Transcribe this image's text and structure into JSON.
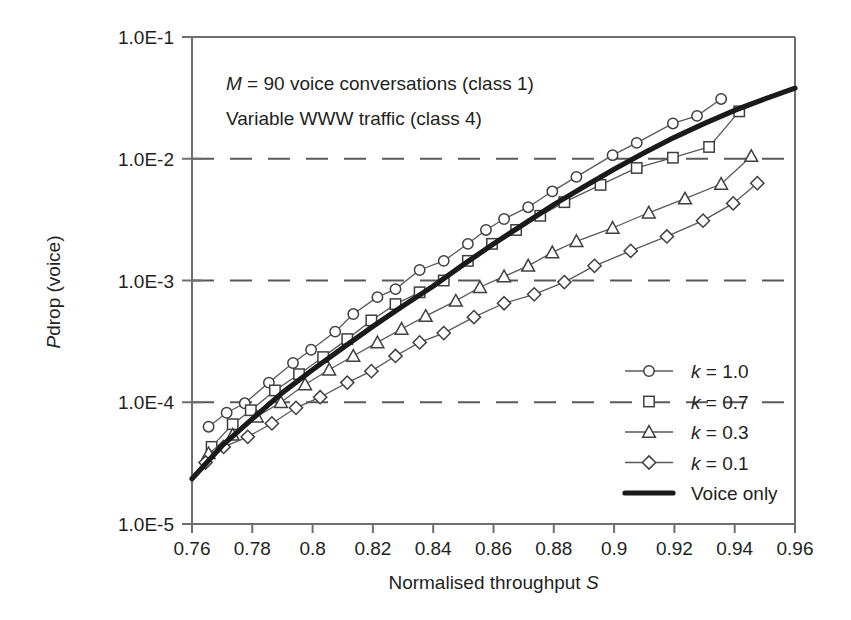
{
  "chart_data": {
    "type": "line",
    "title": "",
    "xlabel": "Normalised throughput S",
    "xlabel_plain": "Normalised throughput ",
    "xlabel_italic": "S",
    "ylabel": "P drop (voice)",
    "ylabel_italic": "P",
    "ylabel_plain": "drop  (voice)",
    "xlim": [
      0.76,
      0.96
    ],
    "ylim": [
      1e-05,
      0.1
    ],
    "yscale": "log",
    "xticks": [
      0.76,
      0.78,
      0.8,
      0.82,
      0.84,
      0.86,
      0.88,
      0.9,
      0.92,
      0.94,
      0.96
    ],
    "xtick_labels": [
      "0.76",
      "0.78",
      "0.8",
      "0.82",
      "0.84",
      "0.86",
      "0.88",
      "0.9",
      "0.92",
      "0.94",
      "0.96"
    ],
    "yticks": [
      1e-05,
      0.0001,
      0.001,
      0.01,
      0.1
    ],
    "ytick_labels": [
      "1.0E-5",
      "1.0E-4",
      "1.0E-3",
      "1.0E-2",
      "1.0E-1"
    ],
    "gridlines_y": [
      0.0001,
      0.001,
      0.01
    ],
    "grid": "horizontal-dashed",
    "legend_position": "lower-right",
    "annotations": [
      {
        "text_italic": "M",
        "text": " = 90 voice conversations (class 1)",
        "full": "M = 90 voice conversations (class 1)"
      },
      {
        "text_italic": "",
        "text": "Variable WWW traffic (class 4)",
        "full": "Variable WWW traffic (class 4)"
      }
    ],
    "series": [
      {
        "name": "k = 1.0",
        "name_italic": "k",
        "name_rest": " = 1.0",
        "marker": "circle",
        "x": [
          0.7655,
          0.7715,
          0.7775,
          0.7855,
          0.7935,
          0.7995,
          0.8075,
          0.8135,
          0.8215,
          0.8275,
          0.8355,
          0.8435,
          0.8515,
          0.8575,
          0.8635,
          0.8715,
          0.8795,
          0.8875,
          0.8995,
          0.9075,
          0.9195,
          0.9275,
          0.9355
        ],
        "y": [
          6.3e-05,
          8.2e-05,
          9.8e-05,
          0.000145,
          0.00021,
          0.00027,
          0.00038,
          0.00053,
          0.00073,
          0.00085,
          0.00122,
          0.00145,
          0.002,
          0.0026,
          0.0032,
          0.004,
          0.0054,
          0.0071,
          0.0107,
          0.0135,
          0.0195,
          0.0225,
          0.031
        ]
      },
      {
        "name": "k = 0.7",
        "name_italic": "k",
        "name_rest": " = 0.7",
        "marker": "square",
        "x": [
          0.7665,
          0.7735,
          0.7795,
          0.7875,
          0.7955,
          0.8035,
          0.8115,
          0.8195,
          0.8275,
          0.8355,
          0.8435,
          0.8515,
          0.8595,
          0.8675,
          0.8755,
          0.8835,
          0.8955,
          0.9075,
          0.9195,
          0.9315,
          0.9415
        ],
        "y": [
          4.3e-05,
          6.6e-05,
          8.6e-05,
          0.000125,
          0.00017,
          0.000235,
          0.00033,
          0.00047,
          0.00064,
          0.0008,
          0.001,
          0.00145,
          0.002,
          0.0026,
          0.0034,
          0.0044,
          0.0061,
          0.0084,
          0.0102,
          0.0125,
          0.0245
        ]
      },
      {
        "name": "k = 0.3",
        "name_italic": "k",
        "name_rest": " = 0.3",
        "marker": "triangle",
        "x": [
          0.7655,
          0.7735,
          0.7815,
          0.7895,
          0.7975,
          0.8055,
          0.8135,
          0.8215,
          0.8295,
          0.8375,
          0.8475,
          0.8555,
          0.8635,
          0.8715,
          0.8795,
          0.8875,
          0.8995,
          0.9115,
          0.9235,
          0.9355,
          0.9455
        ],
        "y": [
          3.8e-05,
          5.4e-05,
          7.6e-05,
          0.0001,
          0.00014,
          0.000185,
          0.00024,
          0.00031,
          0.0004,
          0.00051,
          0.00068,
          0.00088,
          0.00108,
          0.00132,
          0.0017,
          0.0021,
          0.0027,
          0.0036,
          0.0047,
          0.0062,
          0.0105
        ]
      },
      {
        "name": "k = 0.1",
        "name_italic": "k",
        "name_rest": " = 0.1",
        "marker": "diamond",
        "x": [
          0.7645,
          0.7705,
          0.7785,
          0.7865,
          0.7945,
          0.8025,
          0.8115,
          0.8195,
          0.8275,
          0.8355,
          0.8435,
          0.8535,
          0.8635,
          0.8735,
          0.8835,
          0.8935,
          0.9055,
          0.9175,
          0.9295,
          0.9395,
          0.9475
        ],
        "y": [
          3.2e-05,
          4.3e-05,
          5.2e-05,
          6.7e-05,
          9e-05,
          0.00011,
          0.000145,
          0.00018,
          0.00024,
          0.00031,
          0.00037,
          0.0005,
          0.00065,
          0.00077,
          0.00097,
          0.00132,
          0.00175,
          0.0023,
          0.0031,
          0.0043,
          0.0063
        ]
      },
      {
        "name": "Voice only",
        "marker": "none",
        "style": "thick",
        "x": [
          0.76,
          0.77,
          0.78,
          0.79,
          0.8,
          0.81,
          0.82,
          0.83,
          0.84,
          0.85,
          0.86,
          0.87,
          0.88,
          0.89,
          0.9,
          0.91,
          0.92,
          0.93,
          0.94,
          0.95,
          0.96
        ],
        "y": [
          2.35e-05,
          4.4e-05,
          7.3e-05,
          0.00012,
          0.000185,
          0.00028,
          0.00042,
          0.00062,
          0.0009,
          0.00135,
          0.002,
          0.0029,
          0.0042,
          0.0059,
          0.0082,
          0.0112,
          0.015,
          0.0195,
          0.025,
          0.031,
          0.038
        ]
      }
    ],
    "legend_entries": [
      {
        "label": "k = 1.0",
        "label_italic": "k",
        "label_rest": " = 1.0",
        "marker": "circle",
        "with_line": true
      },
      {
        "label": "k = 0.7",
        "label_italic": "k",
        "label_rest": " = 0.7",
        "marker": "square",
        "with_line": false
      },
      {
        "label": "k = 0.3",
        "label_italic": "k",
        "label_rest": " = 0.3",
        "marker": "triangle",
        "with_line": true
      },
      {
        "label": "k = 0.1",
        "label_italic": "k",
        "label_rest": " = 0.1",
        "marker": "diamond",
        "with_line": true
      },
      {
        "label": "Voice only",
        "label_italic": "",
        "label_rest": "Voice only",
        "marker": "thickline",
        "with_line": true
      }
    ],
    "colors": {
      "line": "#58595b",
      "thick_line": "#1a1a1a",
      "axis": "#6d6e71",
      "text": "#231f20",
      "background": "#ffffff"
    }
  }
}
